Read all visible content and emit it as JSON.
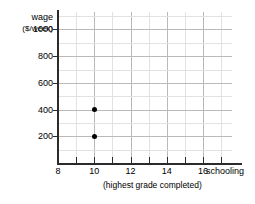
{
  "chart_data": {
    "type": "scatter",
    "title": "",
    "ylabel": "wage",
    "yunits": "($/week)",
    "xlabel": "schooling",
    "xsublabel": "(highest grade completed)",
    "x_ticks": [
      8,
      10,
      12,
      14,
      16
    ],
    "x_tick_labels": [
      "8",
      "10",
      "12",
      "14",
      "16"
    ],
    "y_ticks": [
      200,
      400,
      600,
      800,
      1000
    ],
    "y_tick_labels": [
      "200",
      "400",
      "600",
      "800",
      "1000"
    ],
    "xlim": [
      8,
      17.6
    ],
    "ylim": [
      0,
      1130
    ],
    "grid": true,
    "grid_major_x_step": 2,
    "grid_minor_x_step": 1,
    "grid_major_y_step": 200,
    "grid_minor_y_step": 100,
    "legend": "none",
    "point_color": "#000000",
    "grid_major_color": "#b9b9b9",
    "grid_minor_color": "#e2e2e2",
    "axis_color": "#2b2b2b",
    "points": [
      {
        "x": 10,
        "y": 400
      },
      {
        "x": 10,
        "y": 200
      }
    ]
  }
}
